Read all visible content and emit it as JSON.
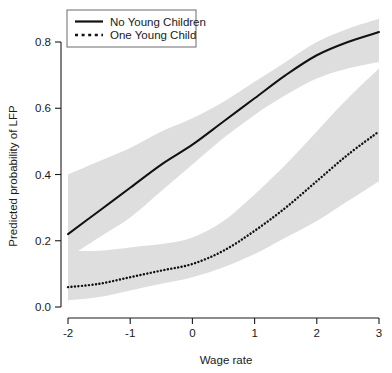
{
  "chart_data": {
    "type": "line",
    "title": "",
    "xlabel": "Wage rate",
    "ylabel": "Predicted probability of LFP",
    "xlim": [
      -2.1,
      3.1
    ],
    "ylim": [
      0.0,
      0.88
    ],
    "xticks": [
      -2,
      -1,
      0,
      1,
      2,
      3
    ],
    "xticklabels": [
      "-2",
      "-1",
      "0",
      "1",
      "2",
      "3"
    ],
    "yticks": [
      0.0,
      0.2,
      0.4,
      0.6,
      0.8
    ],
    "yticklabels": [
      "0.0",
      "0.2",
      "0.4",
      "0.6",
      "0.8"
    ],
    "grid": false,
    "legend_position": "top-left",
    "band_color": "#dedede",
    "line_color": "#111111",
    "x": [
      -2.0,
      -1.5,
      -1.0,
      -0.5,
      0.0,
      0.5,
      1.0,
      1.5,
      2.0,
      2.5,
      3.0
    ],
    "series": [
      {
        "name": "No Young Children",
        "style": "solid",
        "values": [
          0.22,
          0.29,
          0.36,
          0.43,
          0.49,
          0.56,
          0.63,
          0.7,
          0.76,
          0.8,
          0.83
        ],
        "ci_lower": [
          0.15,
          0.21,
          0.27,
          0.35,
          0.43,
          0.51,
          0.58,
          0.64,
          0.69,
          0.72,
          0.74
        ],
        "ci_upper": [
          0.4,
          0.44,
          0.48,
          0.53,
          0.57,
          0.62,
          0.68,
          0.74,
          0.8,
          0.84,
          0.87
        ]
      },
      {
        "name": "One Young Child",
        "style": "dotted",
        "values": [
          0.06,
          0.07,
          0.09,
          0.11,
          0.13,
          0.17,
          0.23,
          0.3,
          0.38,
          0.46,
          0.53
        ],
        "ci_lower": [
          0.02,
          0.03,
          0.05,
          0.07,
          0.09,
          0.12,
          0.16,
          0.21,
          0.26,
          0.32,
          0.38
        ],
        "ci_upper": [
          0.17,
          0.17,
          0.18,
          0.19,
          0.21,
          0.26,
          0.34,
          0.43,
          0.53,
          0.63,
          0.72
        ]
      }
    ]
  },
  "legend": {
    "entries": [
      {
        "label": "No Young Children",
        "style": "solid"
      },
      {
        "label": "One Young Child",
        "style": "dotted"
      }
    ]
  },
  "axes": {
    "x_title": "Wage rate",
    "y_title": "Predicted probability of LFP",
    "x_tick_labels": [
      "-2",
      "-1",
      "0",
      "1",
      "2",
      "3"
    ],
    "y_tick_labels": [
      "0.0",
      "0.2",
      "0.4",
      "0.6",
      "0.8"
    ]
  }
}
